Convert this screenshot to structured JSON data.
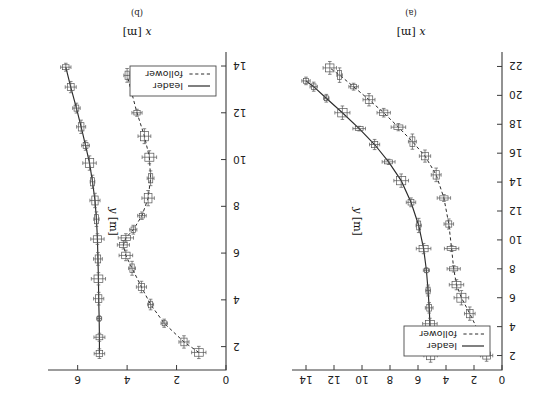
{
  "figure": {
    "rotation_degrees": 180,
    "background_color": "#ffffff",
    "line_color": "#2b2b2b",
    "marker_color": "#555555"
  },
  "panels": [
    {
      "id": "a",
      "caption": "(a)",
      "xlabel_var": "x",
      "xlabel_unit": "[m]",
      "ylabel_var": "y",
      "ylabel_unit": "[m]",
      "legend": {
        "items": [
          {
            "label": "leader",
            "style": "solid"
          },
          {
            "label": "follower",
            "style": "dashed"
          }
        ]
      }
    },
    {
      "id": "b",
      "caption": "(b)",
      "xlabel_var": "x",
      "xlabel_unit": "[m]",
      "ylabel_var": "y",
      "ylabel_unit": "[m]",
      "legend": {
        "items": [
          {
            "label": "leader",
            "style": "solid"
          },
          {
            "label": "follower",
            "style": "dashed"
          }
        ]
      }
    }
  ],
  "chart_data": [
    {
      "panel": "a",
      "type": "line",
      "title": "(a)",
      "xlabel": "x [m]",
      "ylabel": "y [m]",
      "xlim": [
        0,
        15
      ],
      "ylim": [
        1,
        23
      ],
      "xticks": [
        0,
        2,
        4,
        6,
        8,
        10,
        12,
        14
      ],
      "yticks": [
        2,
        4,
        6,
        8,
        10,
        12,
        14,
        16,
        18,
        20,
        22
      ],
      "grid": false,
      "legend_position": "upper-left",
      "errorbars": true,
      "series": [
        {
          "name": "leader",
          "style": "solid",
          "x": [
            5.1,
            5.12,
            5.15,
            5.2,
            5.28,
            5.4,
            5.6,
            5.95,
            6.5,
            7.2,
            8.1,
            9.1,
            10.2,
            11.4,
            12.55,
            13.45,
            14.0
          ],
          "y": [
            2.0,
            3.1,
            4.2,
            5.3,
            6.5,
            7.9,
            9.4,
            11.0,
            12.6,
            14.1,
            15.4,
            16.6,
            17.7,
            18.8,
            19.8,
            20.6,
            21.0
          ]
        },
        {
          "name": "follower",
          "style": "dashed",
          "x": [
            1.1,
            1.55,
            2.3,
            2.9,
            3.25,
            3.45,
            3.6,
            3.8,
            4.15,
            4.7,
            5.5,
            6.4,
            7.4,
            8.45,
            9.5,
            10.6,
            11.6,
            12.3
          ],
          "y": [
            2.0,
            3.4,
            4.9,
            6.0,
            6.9,
            8.0,
            9.4,
            11.1,
            12.9,
            14.5,
            15.8,
            16.8,
            17.8,
            18.8,
            19.7,
            20.6,
            21.4,
            21.9
          ]
        }
      ]
    },
    {
      "panel": "b",
      "type": "line",
      "title": "(b)",
      "xlabel": "x [m]",
      "ylabel": "y [m]",
      "xlim": [
        0,
        7.2
      ],
      "ylim": [
        1,
        14.6
      ],
      "xticks": [
        0,
        2,
        4,
        6
      ],
      "yticks": [
        2,
        4,
        6,
        8,
        10,
        12,
        14
      ],
      "grid": false,
      "legend_position": "lower-left",
      "errorbars": true,
      "series": [
        {
          "name": "leader",
          "style": "solid",
          "x": [
            5.12,
            5.12,
            5.13,
            5.15,
            5.16,
            5.18,
            5.2,
            5.24,
            5.3,
            5.4,
            5.52,
            5.68,
            5.86,
            6.05,
            6.28,
            6.48
          ],
          "y": [
            1.7,
            2.4,
            3.2,
            4.05,
            4.9,
            5.75,
            6.6,
            7.45,
            8.25,
            9.05,
            9.85,
            10.6,
            11.4,
            12.2,
            13.1,
            13.95
          ]
        },
        {
          "name": "follower",
          "style": "dashed",
          "x": [
            1.1,
            1.7,
            2.5,
            3.05,
            3.42,
            3.8,
            4.05,
            4.15,
            4.05,
            3.75,
            3.4,
            3.15,
            3.05,
            3.1,
            3.3,
            3.6,
            4.0
          ],
          "y": [
            1.75,
            2.2,
            3.0,
            3.8,
            4.55,
            5.35,
            5.9,
            6.35,
            6.65,
            7.0,
            7.6,
            8.35,
            9.2,
            10.1,
            11.0,
            12.0,
            13.6
          ]
        }
      ]
    }
  ]
}
